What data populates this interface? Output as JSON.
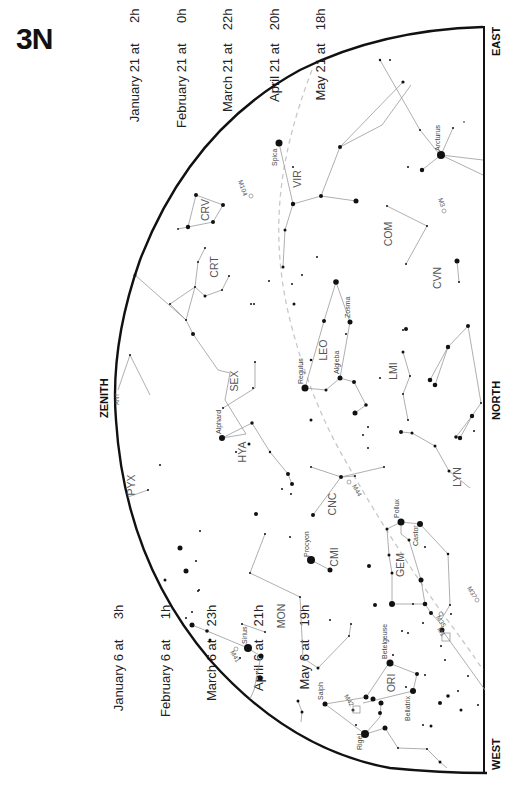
{
  "chart": {
    "title": "3N",
    "time_table_top": [
      {
        "date": "January 21",
        "at": "at",
        "time": "2h"
      },
      {
        "date": "February 21",
        "at": "at",
        "time": "0h"
      },
      {
        "date": "March 21",
        "at": "at",
        "time": "22h"
      },
      {
        "date": "April 21",
        "at": "at",
        "time": "20h"
      },
      {
        "date": "May 21",
        "at": "at",
        "time": "18h"
      }
    ],
    "time_table_bottom": [
      {
        "date": "January 6",
        "at": "at",
        "time": "3h"
      },
      {
        "date": "February 6",
        "at": "at",
        "time": "1h"
      },
      {
        "date": "March 6",
        "at": "at",
        "time": "23h"
      },
      {
        "date": "April 6",
        "at": "at",
        "time": "21h"
      },
      {
        "date": "May 6",
        "at": "at",
        "time": "19h"
      }
    ],
    "directions": {
      "east": "EAST",
      "north": "NORTH",
      "west": "WEST",
      "zenith": "ZENITH"
    },
    "constellations": {
      "vir": "VIR",
      "com": "COM",
      "cvn": "CVN",
      "crv": "CRV",
      "crt": "CRT",
      "leo": "LEO",
      "lmi": "LMI",
      "sex": "SEX",
      "hya": "HYA",
      "ant": "ANT",
      "pyx": "PYX",
      "cnc": "CNC",
      "lyn": "LYN",
      "cmi": "CMI",
      "gem": "GEM",
      "mon": "MON",
      "ori": "ORI"
    },
    "stars": {
      "spica": "Spica",
      "arcturus": "Arcturus",
      "regulus": "Regulus",
      "zosma": "Zosma",
      "algieba": "Algieba",
      "alphard": "Alphard",
      "procyon": "Procyon",
      "pollux": "Pollux",
      "castor": "Castor",
      "betelgeuse": "Betelgeuse",
      "bellatrix": "Bellatrix",
      "saiph": "Saiph",
      "rigel": "Rigel",
      "sirius": "Sirius"
    },
    "deep_sky_objects": {
      "m104": "M104",
      "m3": "M3",
      "m44": "M44",
      "m35": "M35",
      "m37": "M37",
      "m1": "M1",
      "m42": "M42",
      "m41": "M41"
    },
    "colors": {
      "horizon": "#111111",
      "constellation_lines": "#9a9a9a",
      "ecliptic": "#c8c8c8",
      "stars": "#111111"
    }
  }
}
